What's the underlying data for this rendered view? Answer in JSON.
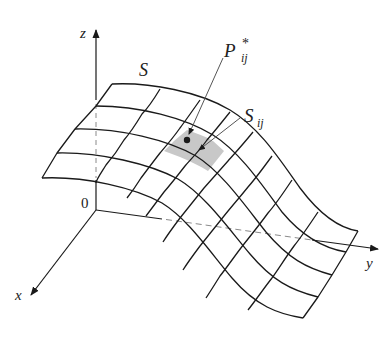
{
  "figure": {
    "type": "surface-patch-diagram",
    "surface_label": "S",
    "patch_label": "S",
    "patch_label_sub": "ij",
    "point_label": "P",
    "point_label_sup": "*",
    "point_label_sub": "ij",
    "origin_label": "0",
    "axes": {
      "x": "x",
      "y": "y",
      "z": "z"
    },
    "grid": {
      "rows": 4,
      "cols": 8,
      "shaded_cell": {
        "row": 1,
        "col": 3
      }
    },
    "colors": {
      "line": "#1a1a1a",
      "shade": "#c8c8c8",
      "dashed": "#8a8a8a",
      "background": "#ffffff"
    }
  }
}
